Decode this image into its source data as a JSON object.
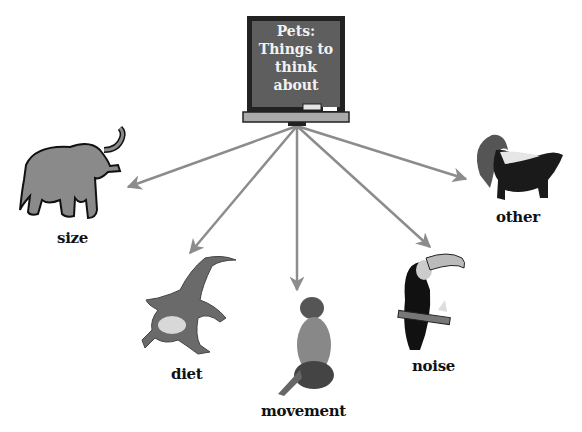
{
  "central_node": {
    "lines": [
      "Pets:",
      "Things to",
      "think",
      "about"
    ],
    "icon": "chalkboard-icon"
  },
  "nodes": [
    {
      "label": "size",
      "icon": "elephant-icon"
    },
    {
      "label": "diet",
      "icon": "crocodile-icon"
    },
    {
      "label": "movement",
      "icon": "monkey-icon"
    },
    {
      "label": "noise",
      "icon": "toucan-icon"
    },
    {
      "label": "other",
      "icon": "skunk-icon"
    }
  ],
  "colors": {
    "arrow": "#8c8c8c",
    "board": "#5a5a5a",
    "board_frame": "#222222",
    "text": "#111111"
  }
}
